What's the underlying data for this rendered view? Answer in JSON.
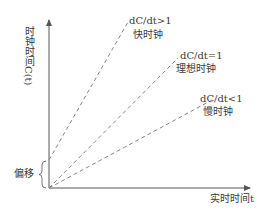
{
  "diagram": {
    "y_axis_label": "时钟时间C(t)",
    "x_axis_label": "实时时间t",
    "offset_label": "偏移",
    "lines": [
      {
        "id": "fast",
        "condition": "dC/dt>1",
        "name": "快时钟",
        "style": "dashed"
      },
      {
        "id": "ideal",
        "condition": "dC/dt=1",
        "name": "理想时钟",
        "style": "dashed"
      },
      {
        "id": "slow",
        "condition": "dC/dt<1",
        "name": "慢时钟",
        "style": "dashed"
      }
    ],
    "colors": {
      "axis": "#555555",
      "dashed_line": "#888888",
      "text": "#3a3a3a"
    }
  }
}
